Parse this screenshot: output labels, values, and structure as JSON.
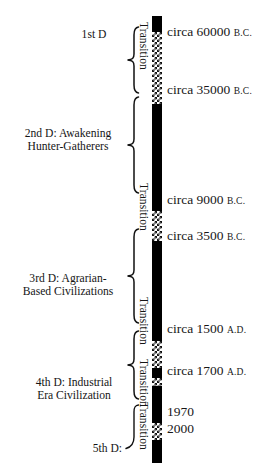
{
  "diagram": {
    "type": "vertical-timeline",
    "bar": {
      "x": 152,
      "top": 16,
      "width": 10,
      "height": 447,
      "era_fill": "#000000",
      "transition_fill": "checkered-black-white",
      "segments": [
        {
          "kind": "era",
          "name": "era-1-pre-awakening",
          "top": 0,
          "height": 16
        },
        {
          "kind": "transition",
          "name": "transition-1",
          "top": 16,
          "height": 72
        },
        {
          "kind": "era",
          "name": "era-2-hunter-gatherers",
          "top": 88,
          "height": 107
        },
        {
          "kind": "transition",
          "name": "transition-2",
          "top": 195,
          "height": 30
        },
        {
          "kind": "era",
          "name": "era-3-agrarian",
          "top": 225,
          "height": 100
        },
        {
          "kind": "transition",
          "name": "transition-3",
          "top": 325,
          "height": 27
        },
        {
          "kind": "era",
          "name": "era-4-industrial",
          "top": 352,
          "height": 10
        },
        {
          "kind": "transition",
          "name": "transition-4",
          "top": 362,
          "height": 8
        },
        {
          "kind": "era",
          "name": "era-4-industrial-main",
          "top": 370,
          "height": 37
        },
        {
          "kind": "transition",
          "name": "transition-5",
          "top": 407,
          "height": 17
        },
        {
          "kind": "era",
          "name": "era-5-emerging",
          "top": 424,
          "height": 23
        }
      ]
    },
    "transition_labels": [
      {
        "name": "transition-label-1",
        "text": "Transition",
        "x": 150,
        "y": 22
      },
      {
        "name": "transition-label-2",
        "text": "Transition",
        "x": 150,
        "y": 183
      },
      {
        "name": "transition-label-3",
        "text": "Transition",
        "x": 150,
        "y": 297
      },
      {
        "name": "transition-label-4",
        "text": "Transition",
        "x": 150,
        "y": 359
      },
      {
        "name": "transition-label-5",
        "text": "Transition",
        "x": 150,
        "y": 402
      }
    ],
    "date_labels": [
      {
        "name": "date-label-60000-bc",
        "value": "circa 60000",
        "era": "B.C.",
        "y": 24
      },
      {
        "name": "date-label-35000-bc",
        "value": "circa 35000",
        "era": "B.C.",
        "y": 82
      },
      {
        "name": "date-label-9000-bc",
        "value": "circa 9000",
        "era": "B.C.",
        "y": 192
      },
      {
        "name": "date-label-3500-bc",
        "value": "circa 3500",
        "era": "B.C.",
        "y": 228
      },
      {
        "name": "date-label-1500-ad",
        "value": "circa 1500",
        "era": "A.D.",
        "y": 321
      },
      {
        "name": "date-label-1700-ad",
        "value": "circa 1700",
        "era": "A.D.",
        "y": 363
      },
      {
        "name": "date-label-1970",
        "value": "1970",
        "era": "",
        "y": 404
      },
      {
        "name": "date-label-2000",
        "value": "2000",
        "era": "",
        "y": 421
      }
    ],
    "era_labels": [
      {
        "name": "era-label-1",
        "ordinal": "1",
        "ordinal_suffix": "st",
        "line1": "1st  D",
        "line2": "",
        "x": 66,
        "y": 28,
        "width": 56,
        "align": "center"
      },
      {
        "name": "era-label-2",
        "line1": "2nd D: Awakening",
        "line2": "Hunter-Gatherers",
        "x": 14,
        "y": 127,
        "width": 108,
        "align": "center"
      },
      {
        "name": "era-label-3",
        "line1": "3rd D: Agrarian-",
        "line2": "Based Civilizations",
        "x": 14,
        "y": 272,
        "width": 108,
        "align": "center"
      },
      {
        "name": "era-label-4",
        "line1": "4th D: Industrial",
        "line2": "Era Civilization",
        "x": 26,
        "y": 376,
        "width": 96,
        "align": "center"
      },
      {
        "name": "era-label-5",
        "line1": "5th D:",
        "line2": "",
        "x": 74,
        "y": 442,
        "width": 48,
        "align": "right"
      }
    ],
    "braces": [
      {
        "name": "brace-era-1",
        "x": 124,
        "y": 26,
        "width": 16,
        "height": 68
      },
      {
        "name": "brace-era-2",
        "x": 124,
        "y": 96,
        "width": 16,
        "height": 98
      },
      {
        "name": "brace-era-3",
        "x": 124,
        "y": 228,
        "width": 16,
        "height": 96
      },
      {
        "name": "brace-era-4",
        "x": 124,
        "y": 330,
        "width": 16,
        "height": 70
      },
      {
        "name": "brace-era-5",
        "x": 124,
        "y": 404,
        "width": 16,
        "height": 46
      }
    ]
  }
}
